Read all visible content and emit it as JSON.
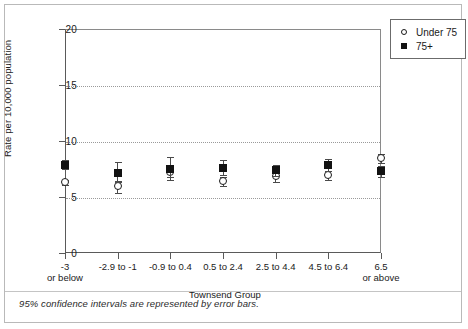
{
  "figure": {
    "caption": "95% confidence intervals are represented by error bars."
  },
  "legend": {
    "position": "top-right",
    "items": [
      {
        "label": "Under 75",
        "marker": "open-circle-icon"
      },
      {
        "label": "75+",
        "marker": "filled-square-icon"
      }
    ]
  },
  "chart_data": {
    "type": "scatter",
    "title": "",
    "xlabel": "Townsend Group",
    "ylabel": "Rate per 10,000 population",
    "ylim": [
      0,
      20
    ],
    "yticks": [
      0,
      5,
      10,
      15,
      20
    ],
    "ytick_labels": [
      "0",
      "5",
      "10",
      "15",
      "20"
    ],
    "grid": "horizontal-dotted at 5, 10, 15",
    "legend_position": "top-right outside",
    "error_bars": "95% confidence intervals",
    "categories": [
      "-3 or below",
      "-2.9 to -1",
      "-0.9 to 0.4",
      "0.5 to 2.4",
      "2.5 to 4.4",
      "4.5 to 6.4",
      "6.5 or above"
    ],
    "category_lines": [
      [
        "-3",
        "or below"
      ],
      [
        "-2.9 to -1",
        ""
      ],
      [
        "-0.9 to 0.4",
        ""
      ],
      [
        "0.5 to 2.4",
        ""
      ],
      [
        "2.5 to 4.4",
        ""
      ],
      [
        "4.5 to 6.4",
        ""
      ],
      [
        "6.5",
        "or above"
      ]
    ],
    "series": [
      {
        "name": "Under 75",
        "marker": "open-circle",
        "values": [
          6.3,
          5.9,
          7.2,
          6.4,
          6.8,
          6.9,
          8.4
        ],
        "ci_low": [
          6.1,
          5.4,
          6.5,
          6.0,
          6.3,
          6.5,
          8.0
        ],
        "ci_high": [
          6.5,
          6.4,
          7.9,
          6.8,
          7.3,
          7.3,
          8.8
        ]
      },
      {
        "name": "75+",
        "marker": "filled-square",
        "values": [
          7.9,
          7.1,
          7.5,
          7.6,
          7.4,
          7.9,
          7.3
        ],
        "ci_low": [
          7.5,
          6.3,
          6.8,
          7.0,
          6.9,
          7.3,
          6.8
        ],
        "ci_high": [
          8.3,
          8.1,
          8.6,
          8.3,
          7.9,
          8.4,
          7.8
        ]
      }
    ]
  }
}
